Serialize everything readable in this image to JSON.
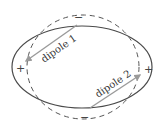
{
  "diagram": {
    "shapes": {
      "ellipse": {
        "style": "solid",
        "color": "#4a4a4a"
      },
      "circle": {
        "style": "dashed",
        "color": "#555555"
      }
    },
    "signs": {
      "top": "−",
      "bottom": "−",
      "left": "+",
      "right": "+"
    },
    "dipoles": [
      {
        "label": "dipole 1",
        "direction": "toward left +",
        "color": "#9a9a9a"
      },
      {
        "label": "dipole 2",
        "direction": "toward right +",
        "color": "#9a9a9a"
      }
    ]
  }
}
